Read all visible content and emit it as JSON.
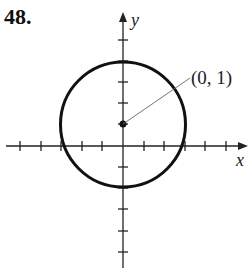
{
  "problem_number": "48.",
  "axes": {
    "x_label": "x",
    "y_label": "y"
  },
  "annotation": {
    "point_label": "(0, 1)",
    "point": [
      0,
      1
    ]
  },
  "circle": {
    "center": [
      0,
      1
    ],
    "radius": 3
  },
  "colors": {
    "stroke": "#111111",
    "leader": "#555555"
  }
}
